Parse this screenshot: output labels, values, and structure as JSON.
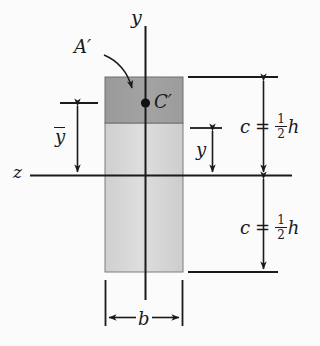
{
  "figure": {
    "background_color": "#fbfbfb",
    "line_color": "#1a1a1a"
  },
  "axes": {
    "vertical_axis_label": "y",
    "horizontal_axis_label": "z"
  },
  "labels": {
    "partial_area": "A′",
    "centroid_partial": "C′",
    "ybar": "y",
    "ybar_has_overbar": true,
    "y_distance": "y",
    "width": "b"
  },
  "dimensions": {
    "c_top": {
      "symbol": "c",
      "equals": "=",
      "numerator": "1",
      "denominator": "2",
      "variable": "h"
    },
    "c_bottom": {
      "symbol": "c",
      "equals": "=",
      "numerator": "1",
      "denominator": "2",
      "variable": "h"
    }
  },
  "shading": {
    "partial_area_fill": "#9d9d9d",
    "remainder_fill": "#d8d8d8",
    "outline": "#6f6f6f"
  },
  "geometry": {
    "rect_left": 105,
    "rect_right": 183,
    "rect_top": 77,
    "rect_bottom": 272,
    "aprime_bottom": 123,
    "neutral_axis_y": 175,
    "centroid_x": 145,
    "centroid_y": 103
  }
}
